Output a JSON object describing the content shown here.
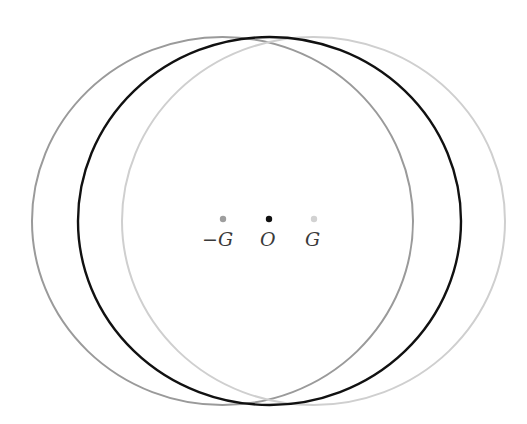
{
  "diagram": {
    "title": "",
    "circles": [
      {
        "name": "circle-minus-G",
        "center_label": "-G",
        "stroke": "#9a9a9a"
      },
      {
        "name": "circle-O",
        "center_label": "O",
        "stroke": "#111111"
      },
      {
        "name": "circle-G",
        "center_label": "G",
        "stroke": "#cfcfcf"
      }
    ],
    "points": [
      {
        "label": "−G",
        "color": "#9e9e9e"
      },
      {
        "label": "O",
        "color": "#111111"
      },
      {
        "label": "G",
        "color": "#d2d2d2"
      }
    ]
  }
}
